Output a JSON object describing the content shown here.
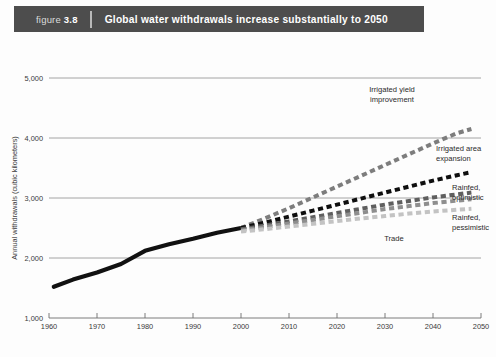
{
  "banner": {
    "figure_prefix": "figure",
    "figure_number": "3.8",
    "title": "Global water withdrawals increase substantially to 2050",
    "bg_color": "#4d4d4d",
    "text_color": "#ffffff"
  },
  "chart_data": {
    "type": "line",
    "title": "Global water withdrawals increase substantially to 2050",
    "xlabel": "",
    "ylabel": "Annual withdrawals (cubic kilometers)",
    "xlim": [
      1960,
      2050
    ],
    "ylim": [
      1000,
      5000
    ],
    "xticks": [
      1960,
      1970,
      1980,
      1990,
      2000,
      2010,
      2020,
      2030,
      2040,
      2050
    ],
    "yticks": [
      1000,
      2000,
      3000,
      4000,
      5000
    ],
    "ytick_labels": [
      "1,000",
      "2,000",
      "3,000",
      "4,000",
      "5,000"
    ],
    "xtick_labels": [
      "1960",
      "1970",
      "1980",
      "1990",
      "2000",
      "2010",
      "2020",
      "2030",
      "2040",
      "2050"
    ],
    "grid": "horizontal",
    "legend_position": "inline-annotations",
    "series": [
      {
        "name": "Historical",
        "style": "solid",
        "color": "#111111",
        "width": 4.2,
        "label": "",
        "x": [
          1961,
          1965,
          1970,
          1975,
          1980,
          1985,
          1990,
          1995,
          2000
        ],
        "y": [
          1520,
          1640,
          1760,
          1900,
          2120,
          2230,
          2320,
          2420,
          2500
        ]
      },
      {
        "name": "Irrigated yield improvement",
        "style": "dashed",
        "color": "#7d7d7d",
        "width": 4.0,
        "label": "Irrigated yield\nimprovement",
        "x": [
          2000,
          2005,
          2010,
          2015,
          2020,
          2025,
          2030,
          2035,
          2040,
          2045,
          2048
        ],
        "y": [
          2500,
          2660,
          2830,
          3010,
          3190,
          3370,
          3550,
          3730,
          3910,
          4080,
          4150
        ]
      },
      {
        "name": "Irrigated area expansion",
        "style": "dashed",
        "color": "#0f0f0f",
        "width": 4.0,
        "label": "Irrigated area\nexpansion",
        "x": [
          2000,
          2005,
          2010,
          2015,
          2020,
          2025,
          2030,
          2035,
          2040,
          2045,
          2048
        ],
        "y": [
          2500,
          2590,
          2690,
          2790,
          2890,
          2990,
          3090,
          3190,
          3290,
          3380,
          3430
        ]
      },
      {
        "name": "Rainfed, optimistic",
        "style": "dashed",
        "color": "#5f5f5f",
        "width": 4.0,
        "label": "Rainfed,\noptimistic",
        "x": [
          2000,
          2005,
          2010,
          2015,
          2020,
          2025,
          2030,
          2035,
          2040,
          2045,
          2048
        ],
        "y": [
          2480,
          2540,
          2610,
          2680,
          2750,
          2820,
          2890,
          2950,
          3010,
          3060,
          3090
        ]
      },
      {
        "name": "Rainfed, pessimistic",
        "style": "dashed",
        "color": "#8e8e8e",
        "width": 4.0,
        "label": "Rainfed,\npessimistic",
        "x": [
          2000,
          2005,
          2010,
          2015,
          2020,
          2025,
          2030,
          2035,
          2040,
          2045,
          2048
        ],
        "y": [
          2460,
          2515,
          2575,
          2635,
          2695,
          2755,
          2815,
          2865,
          2915,
          2955,
          2980
        ]
      },
      {
        "name": "Trade",
        "style": "dashed",
        "color": "#c3c3c3",
        "width": 4.0,
        "label": "Trade",
        "x": [
          2000,
          2005,
          2010,
          2015,
          2020,
          2025,
          2030,
          2035,
          2040,
          2045,
          2048
        ],
        "y": [
          2440,
          2480,
          2525,
          2570,
          2615,
          2660,
          2700,
          2740,
          2775,
          2805,
          2820
        ]
      }
    ],
    "annotations": [
      {
        "id": "irrigated-yield-improvement",
        "line1": "Irrigated yield",
        "line2": "improvement"
      },
      {
        "id": "irrigated-area-expansion",
        "line1": "Irrigated area",
        "line2": "expansion"
      },
      {
        "id": "rainfed-optimistic",
        "line1": "Rainfed,",
        "line2": "optimistic"
      },
      {
        "id": "rainfed-pessimistic",
        "line1": "Rainfed,",
        "line2": "pessimistic"
      },
      {
        "id": "trade",
        "line1": "Trade",
        "line2": ""
      }
    ]
  },
  "colors": {
    "grid": "#9a9a9a",
    "axis": "#6e6e6e",
    "text": "#3a3a3a",
    "page_bg": "#fdfdfd"
  }
}
